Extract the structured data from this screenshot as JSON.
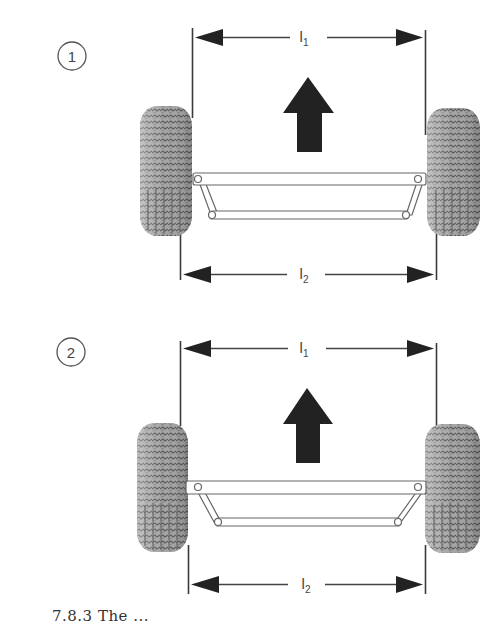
{
  "figure": {
    "colors": {
      "line": "#3a3a3a",
      "arrow_fill": "#222222",
      "tire_base": "#9a9a9a",
      "tire_dark": "#5e5e5e",
      "tire_light": "#c8c8c8",
      "link_fill": "#ffffff",
      "link_stroke": "#666666",
      "background": "#ffffff"
    },
    "panels": [
      {
        "marker": "1",
        "description": "toe-in: front track l1 narrower than rear track l2",
        "top_dimension": {
          "label": "l",
          "subscript": "1"
        },
        "bottom_dimension": {
          "label": "l",
          "subscript": "2"
        },
        "direction": "forward-arrow"
      },
      {
        "marker": "2",
        "description": "toe-out: front track l1 wider than rear track l2",
        "top_dimension": {
          "label": "l",
          "subscript": "1"
        },
        "bottom_dimension": {
          "label": "l",
          "subscript": "2"
        },
        "direction": "forward-arrow"
      }
    ]
  },
  "caption": {
    "text": "7.8.3 The ..."
  }
}
